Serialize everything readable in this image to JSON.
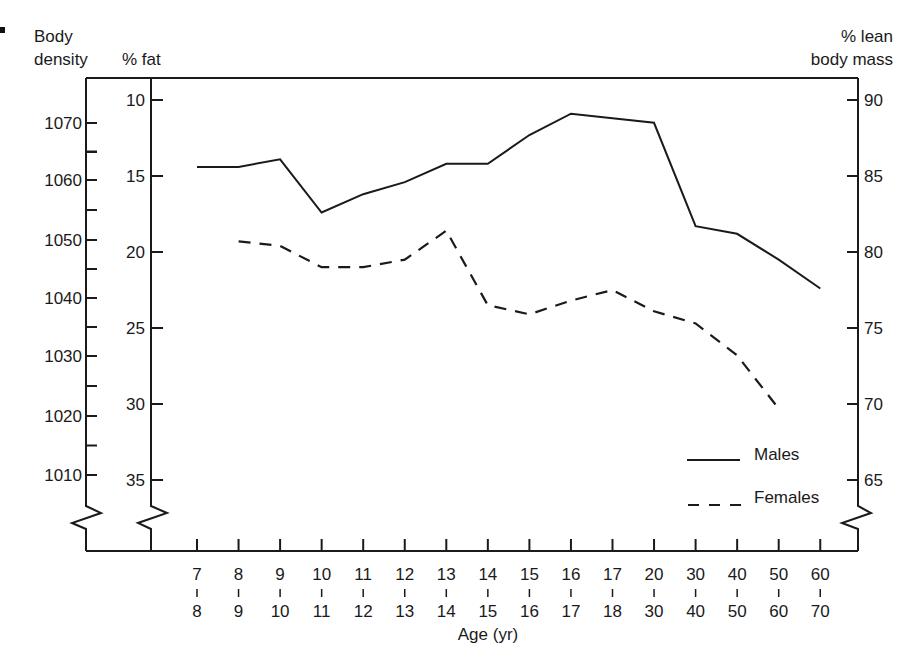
{
  "chart_data": {
    "type": "line",
    "title": "",
    "xlabel": "Age (yr)",
    "ylabel": "% fat",
    "y_axes": {
      "left_outer": {
        "label_line1": "Body",
        "label_line2": "density",
        "ticks": [
          "1070",
          "1060",
          "1050",
          "1040",
          "1030",
          "1020",
          "1010"
        ]
      },
      "left_inner": {
        "label": "% fat",
        "ticks": [
          "10",
          "15",
          "20",
          "25",
          "30",
          "35"
        ],
        "inverted": true,
        "range": [
          10,
          37
        ]
      },
      "right": {
        "label_line1": "% lean",
        "label_line2": "body mass",
        "ticks": [
          "90",
          "85",
          "80",
          "75",
          "70",
          "65"
        ]
      }
    },
    "categories": [
      "7-8",
      "8-9",
      "9-10",
      "10-11",
      "11-12",
      "12-13",
      "13-14",
      "14-15",
      "15-16",
      "16-17",
      "17-18",
      "20-30",
      "30-40",
      "40-50",
      "50-60",
      "60-70"
    ],
    "x_tick_top": [
      "7",
      "8",
      "9",
      "10",
      "11",
      "12",
      "13",
      "14",
      "15",
      "16",
      "17",
      "20",
      "30",
      "40",
      "50",
      "60"
    ],
    "x_tick_bottom": [
      "8",
      "9",
      "10",
      "11",
      "12",
      "13",
      "14",
      "15",
      "16",
      "17",
      "18",
      "30",
      "40",
      "50",
      "60",
      "70"
    ],
    "series": [
      {
        "name": "Males",
        "style": "solid",
        "values": [
          14.4,
          14.4,
          13.9,
          17.4,
          16.2,
          15.4,
          14.2,
          14.2,
          12.3,
          10.9,
          11.2,
          11.5,
          18.3,
          18.8,
          20.5,
          22.4
        ]
      },
      {
        "name": "Females",
        "style": "dashed",
        "values": [
          null,
          19.3,
          19.6,
          21.0,
          21.0,
          20.5,
          18.6,
          23.5,
          24.1,
          23.2,
          22.5,
          23.9,
          24.7,
          26.8,
          30.3,
          null
        ]
      }
    ],
    "legend": {
      "position": "lower-right",
      "entries": [
        "Males",
        "Females"
      ]
    },
    "grid": false
  },
  "labels": {
    "density_line1": "Body",
    "density_line2": "density",
    "fat": "% fat",
    "lean_line1": "% lean",
    "lean_line2": "body mass",
    "xlabel": "Age (yr)",
    "legend_males": "Males",
    "legend_females": "Females"
  }
}
